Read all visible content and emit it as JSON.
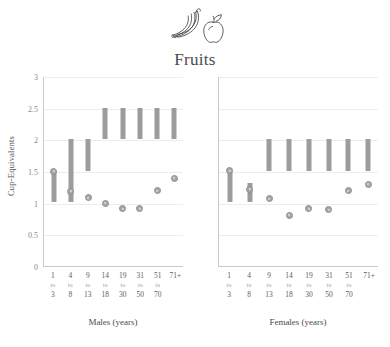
{
  "header": {
    "title": "Fruits",
    "icon": "banana-apple-icon"
  },
  "chart_data": {
    "type": "bar",
    "title": "Fruits",
    "xlabel": "",
    "ylabel": "Cup-Equivalents",
    "ylim": [
      0,
      3
    ],
    "yticks": [
      "0",
      "0.5",
      "1",
      "1.5",
      "2",
      "2.5",
      "3"
    ],
    "grid": true,
    "legend": "none",
    "panels": [
      {
        "name": "Males (years)",
        "axis_title": "Males (years)",
        "categories": [
          {
            "lo": "1",
            "mid": "to",
            "hi": "3"
          },
          {
            "lo": "4",
            "mid": "to",
            "hi": "8"
          },
          {
            "lo": "9",
            "mid": "to",
            "hi": "13"
          },
          {
            "lo": "14",
            "mid": "to",
            "hi": "18"
          },
          {
            "lo": "19",
            "mid": "to",
            "hi": "30"
          },
          {
            "lo": "31",
            "mid": "to",
            "hi": "50"
          },
          {
            "lo": "51",
            "mid": "to",
            "hi": "70"
          },
          {
            "lo": "71+",
            "mid": "",
            "hi": ""
          }
        ],
        "series": [
          {
            "name": "Recommended Intake Range",
            "type": "range-bar",
            "values": [
              {
                "low": 1.0,
                "high": 1.5
              },
              {
                "low": 1.0,
                "high": 2.0
              },
              {
                "low": 1.5,
                "high": 2.0
              },
              {
                "low": 2.0,
                "high": 2.5
              },
              {
                "low": 2.0,
                "high": 2.5
              },
              {
                "low": 2.0,
                "high": 2.5
              },
              {
                "low": 2.0,
                "high": 2.5
              },
              {
                "low": 2.0,
                "high": 2.5
              }
            ]
          },
          {
            "name": "Average Intake",
            "type": "marker",
            "values": [
              1.49,
              1.17,
              1.07,
              0.98,
              0.89,
              0.89,
              1.18,
              1.38
            ]
          }
        ]
      },
      {
        "name": "Females (years)",
        "axis_title": "Females (years)",
        "categories": [
          {
            "lo": "1",
            "mid": "to",
            "hi": "3"
          },
          {
            "lo": "4",
            "mid": "to",
            "hi": "8"
          },
          {
            "lo": "9",
            "mid": "to",
            "hi": "13"
          },
          {
            "lo": "14",
            "mid": "to",
            "hi": "18"
          },
          {
            "lo": "19",
            "mid": "to",
            "hi": "30"
          },
          {
            "lo": "31",
            "mid": "to",
            "hi": "50"
          },
          {
            "lo": "51",
            "mid": "to",
            "hi": "70"
          },
          {
            "lo": "71+",
            "mid": "",
            "hi": ""
          }
        ],
        "series": [
          {
            "name": "Recommended Intake Range",
            "type": "range-bar",
            "values": [
              {
                "low": 1.0,
                "high": 1.5
              },
              {
                "low": 1.0,
                "high": 1.3
              },
              {
                "low": 1.5,
                "high": 2.0
              },
              {
                "low": 1.5,
                "high": 2.0
              },
              {
                "low": 1.5,
                "high": 2.0
              },
              {
                "low": 1.5,
                "high": 2.0
              },
              {
                "low": 1.5,
                "high": 2.0
              },
              {
                "low": 1.5,
                "high": 2.0
              }
            ]
          },
          {
            "name": "Average Intake",
            "type": "marker",
            "values": [
              1.5,
              1.2,
              1.05,
              0.79,
              0.89,
              0.88,
              1.18,
              1.28
            ]
          }
        ]
      }
    ],
    "colors": {
      "bar": "#9c9c9c",
      "marker": "#a8a8a8",
      "grid": "#ededed",
      "axis": "#c9c9c9",
      "text": "#4a4a4a"
    }
  }
}
